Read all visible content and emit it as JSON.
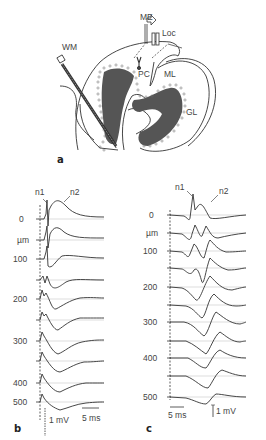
{
  "panel_a": {
    "label": "a",
    "annotations": {
      "me": "ME",
      "loc": "Loc",
      "wm": "WM",
      "pc": "PC",
      "ml": "ML",
      "gl": "GL"
    }
  },
  "panel_b": {
    "label": "b",
    "peak_labels": {
      "n1": "n1",
      "n2": "n2"
    },
    "depth_labels": [
      "0",
      "µm",
      "100",
      "200",
      "300",
      "400",
      "500"
    ],
    "scale_voltage": "1 mV",
    "scale_time": "5 ms",
    "trace_count": 10
  },
  "panel_c": {
    "label": "c",
    "peak_labels": {
      "n1": "n1",
      "n2": "n2"
    },
    "depth_labels": [
      "0",
      "µm",
      "100",
      "200",
      "300",
      "400",
      "500"
    ],
    "scale_voltage": "1 mV",
    "scale_time": "5 ms",
    "trace_count": 11
  }
}
